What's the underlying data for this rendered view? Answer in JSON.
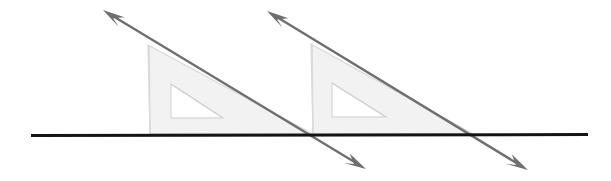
{
  "canvas": {
    "width": 611,
    "height": 181,
    "background": "#ffffff"
  },
  "figure": {
    "kind": "geometry-construction-diagram",
    "colors": {
      "line_dark": "#141414",
      "ray_gray": "#6f6f6f",
      "triangle_fill": "#f2f2f2",
      "triangle_edge": "#d8d8d8",
      "cutout_fill": "#ffffff",
      "cutout_edge": "#dcdcdc"
    }
  },
  "baseline": {
    "label": "horizontal-base-line",
    "x1": 31,
    "y1": 135.5,
    "x2": 588,
    "y2": 134.5,
    "stroke_width": 3,
    "color": "#141414"
  },
  "triangles": [
    {
      "label": "set-square-left",
      "apex": {
        "x": 148,
        "y": 45
      },
      "bottom_left": {
        "x": 150,
        "y": 134
      },
      "bottom_right": {
        "x": 313,
        "y": 134
      },
      "cutout": {
        "apex": {
          "x": 171,
          "y": 84
        },
        "bottom_left": {
          "x": 171,
          "y": 118
        },
        "bottom_right": {
          "x": 223,
          "y": 118
        }
      }
    },
    {
      "label": "set-square-right",
      "apex": {
        "x": 311,
        "y": 44
      },
      "bottom_left": {
        "x": 313,
        "y": 134
      },
      "bottom_right": {
        "x": 473,
        "y": 134
      },
      "cutout": {
        "apex": {
          "x": 332,
          "y": 83
        },
        "bottom_left": {
          "x": 332,
          "y": 117
        },
        "bottom_right": {
          "x": 386,
          "y": 117
        }
      }
    }
  ],
  "rays": [
    {
      "label": "transversal-ray-left",
      "head_tip": {
        "x": 103,
        "y": 10
      },
      "tail_tip": {
        "x": 366,
        "y": 169
      },
      "stroke_width": 2.4,
      "color": "#6f6f6f",
      "arrowheads": [
        "start",
        "end"
      ]
    },
    {
      "label": "transversal-ray-right",
      "head_tip": {
        "x": 267,
        "y": 11
      },
      "tail_tip": {
        "x": 528,
        "y": 170
      },
      "stroke_width": 2.4,
      "color": "#6f6f6f",
      "arrowheads": [
        "start",
        "end"
      ]
    }
  ]
}
